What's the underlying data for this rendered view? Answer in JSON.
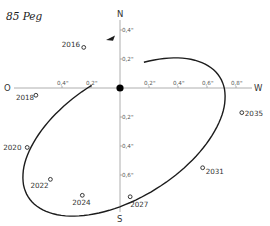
{
  "title": "85 Peg",
  "axes": {
    "north": "N",
    "south": "S",
    "east": "O",
    "west": "W"
  },
  "chart_data": {
    "type": "orbit",
    "title": "85 Peg",
    "x_ticks_left": [
      "0,4\"",
      "0,2\""
    ],
    "x_ticks_right": [
      "0,2\"",
      "0,4\"",
      "0,6\"",
      "0,8\""
    ],
    "y_ticks_up": [
      "0,2\"",
      "0,4\""
    ],
    "y_ticks_down": [
      "0,2\"",
      "0,4\"",
      "0,6\""
    ],
    "x_tick_values_left": [
      -0.4,
      -0.2
    ],
    "x_tick_values_right": [
      0.2,
      0.4,
      0.6,
      0.8
    ],
    "y_tick_values_up": [
      0.2,
      0.4
    ],
    "y_tick_values_down": [
      -0.2,
      -0.4,
      -0.6
    ],
    "units": "arcsec",
    "positions": [
      {
        "year": "2016",
        "x": -0.25,
        "y": 0.28
      },
      {
        "year": "2018",
        "x": -0.58,
        "y": -0.05
      },
      {
        "year": "2020",
        "x": -0.64,
        "y": -0.41
      },
      {
        "year": "2022",
        "x": -0.48,
        "y": -0.63
      },
      {
        "year": "2024",
        "x": -0.26,
        "y": -0.74
      },
      {
        "year": "2027",
        "x": 0.07,
        "y": -0.75
      },
      {
        "year": "2031",
        "x": 0.57,
        "y": -0.55
      },
      {
        "year": "2035",
        "x": 0.84,
        "y": -0.17
      }
    ],
    "motion_direction": "counterclockwise-arrow-toward-2016"
  }
}
